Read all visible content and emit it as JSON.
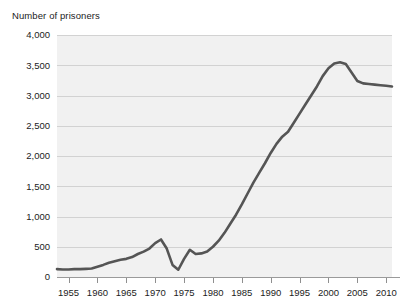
{
  "chart_data": {
    "type": "line",
    "title": "Number of prisoners",
    "xlabel": "",
    "ylabel": "",
    "grid": true,
    "legend": "none",
    "xlim": [
      1953,
      2011
    ],
    "ylim": [
      0,
      4000
    ],
    "yticks": [
      0,
      500,
      1000,
      1500,
      2000,
      2500,
      3000,
      3500,
      4000
    ],
    "ytick_labels": [
      "0",
      "500",
      "1,000",
      "1,500",
      "2,000",
      "2,500",
      "3,000",
      "3,500",
      "4,000"
    ],
    "xticks": [
      1955,
      1960,
      1965,
      1970,
      1975,
      1980,
      1985,
      1990,
      1995,
      2000,
      2005,
      2010
    ],
    "xtick_labels": [
      "1955",
      "1960",
      "1965",
      "1970",
      "1975",
      "1980",
      "1985",
      "1990",
      "1995",
      "2000",
      "2005",
      "2010"
    ],
    "series": [
      {
        "name": "Number of prisoners",
        "color": "#555555",
        "x": [
          1953,
          1954,
          1955,
          1956,
          1957,
          1958,
          1959,
          1960,
          1961,
          1962,
          1963,
          1964,
          1965,
          1966,
          1967,
          1968,
          1969,
          1970,
          1971,
          1972,
          1973,
          1974,
          1975,
          1976,
          1977,
          1978,
          1979,
          1980,
          1981,
          1982,
          1983,
          1984,
          1985,
          1986,
          1987,
          1988,
          1989,
          1990,
          1991,
          1992,
          1993,
          1994,
          1995,
          1996,
          1997,
          1998,
          1999,
          2000,
          2001,
          2002,
          2003,
          2004,
          2005,
          2006,
          2007,
          2008,
          2009,
          2010,
          2011
        ],
        "values": [
          130,
          125,
          125,
          130,
          130,
          135,
          140,
          170,
          200,
          235,
          260,
          285,
          300,
          330,
          380,
          420,
          470,
          560,
          620,
          470,
          200,
          120,
          300,
          450,
          380,
          390,
          420,
          500,
          600,
          730,
          880,
          1030,
          1200,
          1380,
          1560,
          1720,
          1880,
          2050,
          2200,
          2320,
          2400,
          2550,
          2700,
          2850,
          3000,
          3150,
          3320,
          3450,
          3530,
          3550,
          3520,
          3380,
          3240,
          3200,
          3190,
          3180,
          3170,
          3160,
          3150
        ]
      }
    ]
  }
}
